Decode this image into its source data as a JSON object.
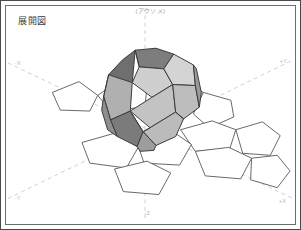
{
  "figure": {
    "title": "展開図",
    "projection_label": "(アクソメ)",
    "background_color": "#ffffff",
    "frame_color": "#4a4a4a",
    "inner_frame_color": "#6d6d6d"
  },
  "axes": {
    "style": "dashed",
    "color": "#cfcfcf",
    "labels": {
      "neg_x": "-X",
      "pos_x": "+X",
      "neg_y": "-Y",
      "pos_y": "+Y",
      "pos_z": "+Z",
      "neg_z": "-Z"
    }
  },
  "solid": {
    "name": "dodecahedron",
    "faces": 12,
    "edge_color": "#3a3a3a",
    "face_light": "#d2d2d2",
    "face_mid": "#b6b6b6",
    "face_dark": "#8f8f8f",
    "face_darkest": "#6f6f6f"
  },
  "net": {
    "name": "pentagon-net",
    "face_count": 11,
    "edge_color": "#555555",
    "fill": "#ffffff"
  }
}
